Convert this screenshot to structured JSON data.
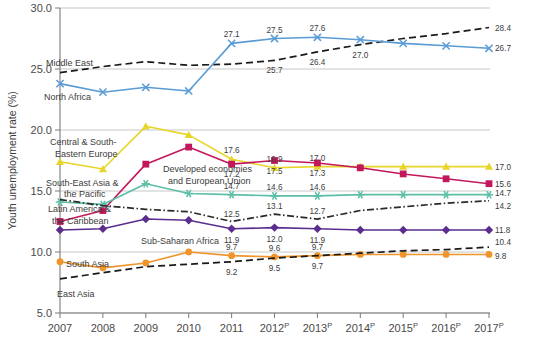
{
  "chart_data": {
    "type": "line",
    "title": "",
    "xlabel": "",
    "ylabel": "Youth unemployment rate (%)",
    "ylim": [
      5.0,
      30.0
    ],
    "ytick_labels": [
      "30.0",
      "25.0",
      "20.0",
      "15.0",
      "10.0",
      "5.0"
    ],
    "ytick_values": [
      30.0,
      25.0,
      20.0,
      15.0,
      10.0,
      5.0
    ],
    "grid": true,
    "legend_position": "inline-annotations",
    "categories": [
      "2007",
      "2008",
      "2009",
      "2010",
      "2011",
      "2012",
      "2013",
      "2014",
      "2015",
      "2016",
      "2017"
    ],
    "xtick_labels": [
      "2007",
      "2008",
      "2009",
      "2010",
      "2011",
      "2012",
      "2013",
      "2014",
      "2015",
      "2016",
      "2017"
    ],
    "projected_from": "2012",
    "projection_suffix": "P",
    "series": [
      {
        "name": "Middle East",
        "color": "#1a1a1a",
        "style": "dashed",
        "marker": "none",
        "values": [
          24.7,
          25.2,
          25.6,
          25.3,
          25.4,
          25.7,
          26.4,
          27.0,
          27.5,
          27.9,
          28.4
        ],
        "labels": [
          null,
          null,
          null,
          null,
          null,
          "25.7",
          "26.4",
          "27.0",
          null,
          null,
          "28.4"
        ]
      },
      {
        "name": "North Africa",
        "color": "#5b9bd5",
        "style": "solid",
        "marker": "x",
        "values": [
          23.8,
          23.1,
          23.5,
          23.2,
          27.1,
          27.5,
          27.6,
          27.4,
          27.1,
          26.9,
          26.7
        ],
        "labels": [
          null,
          null,
          null,
          null,
          "27.1",
          "27.5",
          "27.6",
          null,
          null,
          null,
          "26.7"
        ]
      },
      {
        "name": "Central & South-Eastern Europe",
        "color": "#e8d52a",
        "style": "solid",
        "marker": "triangle",
        "values": [
          17.4,
          16.8,
          20.3,
          19.6,
          17.6,
          16.9,
          17.0,
          17.0,
          17.0,
          17.0,
          17.0
        ],
        "labels": [
          null,
          null,
          null,
          null,
          "17.6",
          "16.9",
          "17.0",
          null,
          null,
          null,
          "17.0"
        ]
      },
      {
        "name": "Developed economies and European Union",
        "color": "#c2185b",
        "style": "solid",
        "marker": "square",
        "values": [
          12.5,
          13.4,
          17.2,
          18.6,
          17.2,
          17.5,
          17.3,
          16.9,
          16.4,
          16.0,
          15.6
        ],
        "labels": [
          null,
          null,
          null,
          null,
          "17.2",
          "17.5",
          "17.3",
          null,
          null,
          null,
          "15.6"
        ]
      },
      {
        "name": "Latin America & the Caribbean",
        "color": "#5cbfa6",
        "style": "solid",
        "marker": "asterisk",
        "values": [
          14.1,
          13.9,
          15.6,
          14.8,
          14.7,
          14.6,
          14.6,
          14.7,
          14.7,
          14.7,
          14.7
        ],
        "labels": [
          null,
          null,
          null,
          null,
          "14.7",
          "14.6",
          "14.6",
          null,
          null,
          null,
          "14.7"
        ]
      },
      {
        "name": "South-East Asia & the Pacific",
        "color": "#2a2a2a",
        "style": "dashdot",
        "marker": "none",
        "values": [
          14.3,
          13.8,
          13.5,
          13.3,
          12.5,
          13.1,
          12.7,
          13.4,
          13.7,
          14.0,
          14.2
        ],
        "labels": [
          null,
          null,
          null,
          null,
          "12.5",
          "13.1",
          "12.7",
          null,
          null,
          null,
          "14.2"
        ]
      },
      {
        "name": "Sub-Saharan Africa",
        "color": "#5b2d8e",
        "style": "solid",
        "marker": "diamond",
        "values": [
          11.8,
          11.9,
          12.7,
          12.6,
          11.9,
          12.0,
          11.9,
          11.8,
          11.8,
          11.8,
          11.8
        ],
        "labels": [
          null,
          null,
          null,
          null,
          "11.9",
          "12.0",
          "11.9",
          null,
          null,
          null,
          "11.8"
        ]
      },
      {
        "name": "South Asia",
        "color": "#f0942c",
        "style": "solid",
        "marker": "circle",
        "values": [
          9.2,
          8.7,
          9.1,
          10.0,
          9.7,
          9.6,
          9.7,
          9.8,
          9.8,
          9.8,
          9.8
        ],
        "labels": [
          null,
          null,
          null,
          null,
          "9.7",
          "9.6",
          "9.7",
          null,
          null,
          null,
          "9.8"
        ]
      },
      {
        "name": "East Asia",
        "color": "#1a1a1a",
        "style": "dashed",
        "marker": "none",
        "values": [
          7.8,
          8.3,
          8.8,
          9.0,
          9.2,
          9.5,
          9.7,
          9.9,
          10.1,
          10.2,
          10.4
        ],
        "labels": [
          null,
          null,
          null,
          null,
          "9.2",
          "9.5",
          "9.7",
          null,
          null,
          null,
          "10.4"
        ]
      }
    ],
    "annotations": [
      {
        "text": "Middle East",
        "series": "Middle East",
        "x": 46,
        "y": 66
      },
      {
        "text": "North Africa",
        "series": "North Africa",
        "x": 44,
        "y": 100
      },
      {
        "text": "Central & South-",
        "series": "Central & South-Eastern Europe",
        "x": 50,
        "y": 145
      },
      {
        "text": "Eastern Europe",
        "series": "Central & South-Eastern Europe",
        "x": 55,
        "y": 157
      },
      {
        "text": "South-East Asia &",
        "series": "South-East Asia & the Pacific",
        "x": 46,
        "y": 186
      },
      {
        "text": "the Pacific",
        "series": "South-East Asia & the Pacific",
        "x": 64,
        "y": 197
      },
      {
        "text": "Latin America &",
        "series": "Latin America & the Caribbean",
        "x": 48,
        "y": 212
      },
      {
        "text": "the Caribbean",
        "series": "Latin America & the Caribbean",
        "x": 52,
        "y": 224
      },
      {
        "text": "Developed economies",
        "series": "Developed economies and European Union",
        "x": 163,
        "y": 172
      },
      {
        "text": "and European Union",
        "series": "Developed economies and European Union",
        "x": 168,
        "y": 184
      },
      {
        "text": "Sub-Saharan Africa",
        "series": "Sub-Saharan Africa",
        "x": 141,
        "y": 244
      },
      {
        "text": "South Asia",
        "series": "South Asia",
        "x": 66,
        "y": 267
      },
      {
        "text": "East Asia",
        "series": "East Asia",
        "x": 57,
        "y": 297
      }
    ]
  }
}
